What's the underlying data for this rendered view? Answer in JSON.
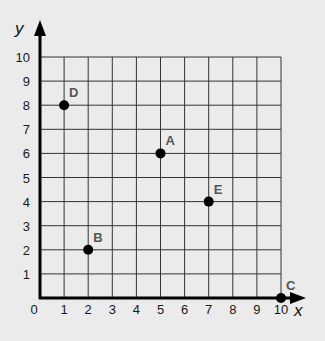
{
  "chart_data": {
    "type": "scatter",
    "title": "",
    "xlabel": "x",
    "ylabel": "y",
    "xlim": [
      0,
      10
    ],
    "ylim": [
      0,
      10
    ],
    "grid": true,
    "x_ticks": [
      "0",
      "1",
      "2",
      "3",
      "4",
      "5",
      "6",
      "7",
      "8",
      "9",
      "10"
    ],
    "y_ticks": [
      "1",
      "2",
      "3",
      "4",
      "5",
      "6",
      "7",
      "8",
      "9",
      "10"
    ],
    "points": [
      {
        "label": "A",
        "x": 5,
        "y": 6
      },
      {
        "label": "B",
        "x": 2,
        "y": 2
      },
      {
        "label": "C",
        "x": 10,
        "y": 0
      },
      {
        "label": "D",
        "x": 1,
        "y": 8
      },
      {
        "label": "E",
        "x": 7,
        "y": 4
      }
    ]
  },
  "colors": {
    "background": "#ebebeb",
    "grid": "#333333",
    "axis": "#000000",
    "point": "#000000",
    "point_label": "#555555"
  }
}
